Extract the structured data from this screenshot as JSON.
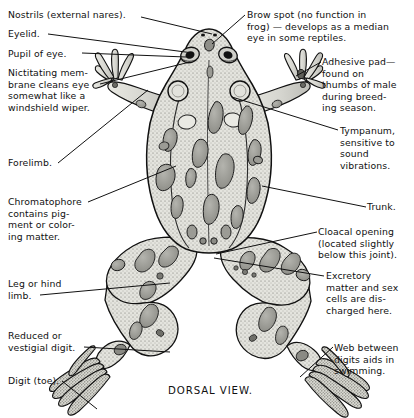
{
  "figure": {
    "caption": "DORSAL VIEW.",
    "subject": "frog",
    "style": "line-engraving with stipple shading",
    "colors": {
      "background": "#ffffff",
      "ink": "#111111",
      "body_fill": "#dcdcd6",
      "spot_fill": "#9a9a94",
      "stipple": "#6b6b66"
    }
  },
  "labels": [
    {
      "id": "nostrils",
      "text": "Nostrils  (external  nares).",
      "side": "left",
      "x": 8,
      "y": 9,
      "leader_from": [
        141,
        17
      ],
      "leader_to": [
        212,
        34
      ]
    },
    {
      "id": "eyelid",
      "text": "Eyelid.",
      "side": "left",
      "x": 8,
      "y": 28,
      "leader_from": [
        48,
        34
      ],
      "leader_to": [
        193,
        53
      ]
    },
    {
      "id": "pupil-of-eye",
      "text": "Pupil of eye.",
      "side": "left",
      "x": 8,
      "y": 48,
      "leader_from": [
        82,
        53
      ],
      "leader_to": [
        186,
        57
      ]
    },
    {
      "id": "nictitating-membrane",
      "text": "Nictitating mem-\nbrane cleans eye\nsomewhat like a\nwindshield wiper.",
      "side": "left",
      "x": 8,
      "y": 67,
      "leader_from": [
        100,
        84
      ],
      "leader_to": [
        190,
        62
      ]
    },
    {
      "id": "forelimb",
      "text": "Forelimb.",
      "side": "left",
      "x": 8,
      "y": 157,
      "leader_from": [
        58,
        163
      ],
      "leader_to": [
        148,
        90
      ]
    },
    {
      "id": "chromatophore",
      "text": "Chromatophore\ncontains pig-\nment or color-\ning matter.",
      "side": "left",
      "x": 8,
      "y": 196,
      "leader_from": [
        88,
        202
      ],
      "leader_to": [
        176,
        166
      ]
    },
    {
      "id": "leg-or-hind-limb",
      "text": "Leg or hind\nlimb.",
      "side": "left",
      "x": 8,
      "y": 278,
      "leader_from": [
        40,
        295
      ],
      "leader_to": [
        170,
        283
      ]
    },
    {
      "id": "reduced-vestigial-digit",
      "text": "Reduced or\nvestigial digit.",
      "side": "left",
      "x": 8,
      "y": 330,
      "leader_from": [
        84,
        347
      ],
      "leader_to": [
        170,
        352
      ]
    },
    {
      "id": "digit-toe",
      "text": "Digit (toe).",
      "side": "left",
      "x": 8,
      "y": 375,
      "leader_from": [
        62,
        381
      ],
      "leader_to": [
        97,
        409
      ]
    },
    {
      "id": "brow-spot",
      "text": "Brow spot (no function in\nfrog) — develops as a median\neye in some reptiles.",
      "side": "right",
      "x": 247,
      "y": 9,
      "leader_from": [
        245,
        15
      ],
      "leader_to": [
        212,
        44
      ]
    },
    {
      "id": "adhesive-pad",
      "text": "Adhesive pad—\nfound on\nthumbs of male\nduring breed-\ning season.",
      "side": "right",
      "x": 322,
      "y": 56,
      "leader_from": [
        321,
        62
      ],
      "leader_to": [
        296,
        76
      ]
    },
    {
      "id": "tympanum",
      "text": "Tympanum,\nsensitive to\nsound\nvibrations.",
      "side": "right",
      "x": 340,
      "y": 125,
      "leader_from": [
        338,
        130
      ],
      "leader_to": [
        232,
        97
      ]
    },
    {
      "id": "trunk",
      "text": "Trunk.",
      "side": "right",
      "x": 367,
      "y": 201,
      "leader_from": [
        366,
        207
      ],
      "leader_to": [
        262,
        186
      ]
    },
    {
      "id": "cloacal-opening",
      "text": "Cloacal opening\n(located slightly\nbelow this joint).",
      "side": "right",
      "x": 318,
      "y": 226,
      "leader_from": [
        317,
        232
      ],
      "leader_to": [
        216,
        254
      ]
    },
    {
      "id": "excretory-matter",
      "text": "Excretory\nmatter and sex\ncells are dis-\ncharged here.",
      "side": "right",
      "x": 326,
      "y": 270,
      "leader_from": [
        324,
        276
      ],
      "leader_to": [
        214,
        258
      ]
    },
    {
      "id": "web-between-digits",
      "text": "Web between\ndigits aids in\nswimming.",
      "side": "right",
      "x": 334,
      "y": 342,
      "leader_from": [
        333,
        347
      ],
      "leader_to": [
        300,
        377
      ]
    }
  ]
}
